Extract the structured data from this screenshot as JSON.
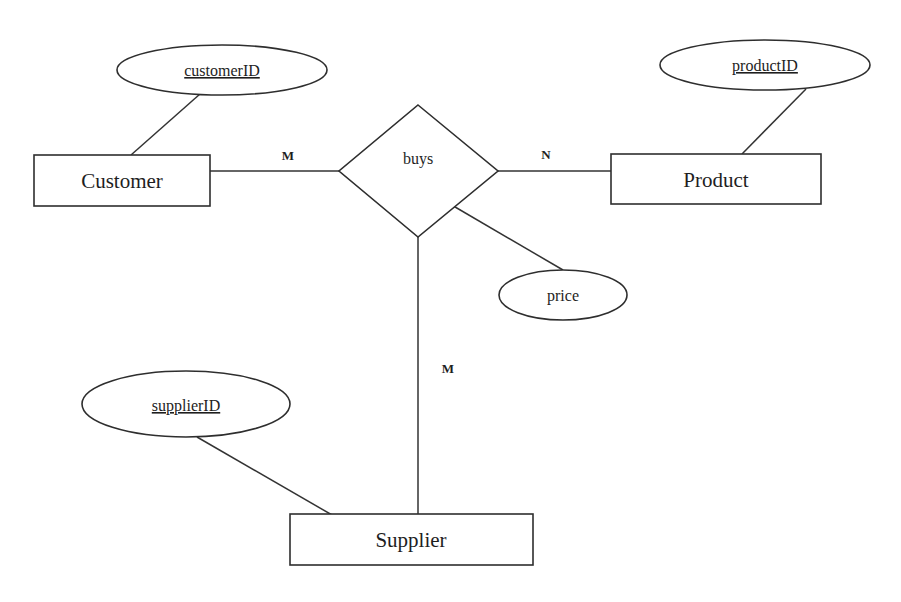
{
  "diagram": {
    "type": "er-diagram",
    "background": "#ffffff",
    "stroke_color": "#2e2e2e",
    "entities": [
      {
        "id": "customer",
        "label": "Customer",
        "x": 34,
        "y": 155,
        "w": 176,
        "h": 51
      },
      {
        "id": "product",
        "label": "Product",
        "x": 611,
        "y": 154,
        "w": 210,
        "h": 50
      },
      {
        "id": "supplier",
        "label": "Supplier",
        "x": 290,
        "y": 514,
        "w": 243,
        "h": 51
      }
    ],
    "relationships": [
      {
        "id": "buys",
        "label": "buys",
        "top": [
          418,
          105
        ],
        "left": [
          339,
          171
        ],
        "right": [
          498,
          171
        ],
        "bottom": [
          418,
          237
        ]
      }
    ],
    "attributes": [
      {
        "id": "customerID",
        "label": "customerID",
        "key": true,
        "cx": 222,
        "cy": 70,
        "rx": 105,
        "ry": 25,
        "entity": "customer"
      },
      {
        "id": "productID",
        "label": "productID",
        "key": true,
        "cx": 765,
        "cy": 65,
        "rx": 105,
        "ry": 25,
        "entity": "product"
      },
      {
        "id": "price",
        "label": "price",
        "key": false,
        "cx": 563,
        "cy": 295,
        "rx": 64,
        "ry": 25,
        "entity": "buys"
      },
      {
        "id": "supplierID",
        "label": "supplierID",
        "key": true,
        "cx": 186,
        "cy": 404,
        "rx": 104,
        "ry": 33,
        "entity": "supplier"
      }
    ],
    "cardinalities": [
      {
        "id": "customer-buys",
        "label": "M",
        "x": 288,
        "y": 160
      },
      {
        "id": "product-buys",
        "label": "N",
        "x": 546,
        "y": 159
      },
      {
        "id": "supplier-buys",
        "label": "M",
        "x": 448,
        "y": 373
      }
    ]
  }
}
